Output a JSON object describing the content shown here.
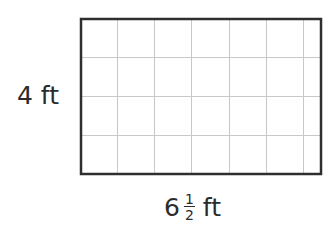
{
  "figure": {
    "shape": "rectangle",
    "grid": {
      "columns_full": 6,
      "columns_partial": 0.5,
      "rows": 4
    },
    "colors": {
      "border": "#2e2e2e",
      "grid": "#c8c8c8",
      "background": "#ffffff"
    }
  },
  "labels": {
    "height": {
      "value": "4",
      "unit": "ft"
    },
    "width": {
      "whole": "6",
      "numerator": "1",
      "denominator": "2",
      "unit": "ft"
    }
  }
}
